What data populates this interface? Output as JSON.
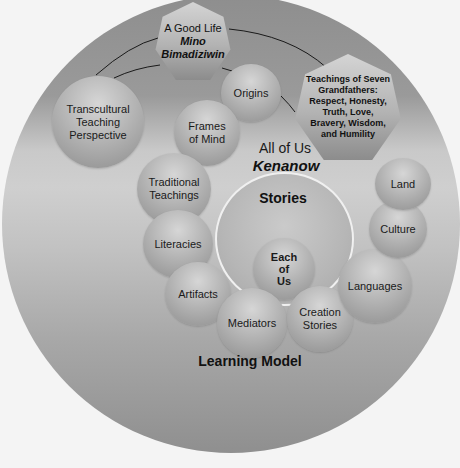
{
  "diagram": {
    "title": "Learning Model",
    "colors": {
      "background": "#f4f4f4",
      "outer_circle_dark": "#8e8e8e",
      "outer_circle_light": "#cfcfcf",
      "node_fill": "#b5b5b5",
      "ring_stroke": "#f0f0f0",
      "text": "#1a1a1a"
    },
    "heptagons": {
      "good_life": {
        "line1": "A Good Life",
        "line2": "Mino",
        "line3": "Bimadiziwin"
      },
      "seven_grandfathers": {
        "line1": "Teachings of Seven",
        "line2": "Grandfathers:",
        "line3": "Respect, Honesty,",
        "line4": "Truth, Love,",
        "line5": "Bravery, Wisdom,",
        "line6": "and Humility"
      }
    },
    "nodes": {
      "transcultural": {
        "line1": "Transcultural",
        "line2": "Teaching",
        "line3": "Perspective"
      },
      "origins": {
        "line1": "Origins"
      },
      "frames_of_mind": {
        "line1": "Frames",
        "line2": "of Mind"
      },
      "traditional_teachings": {
        "line1": "Traditional",
        "line2": "Teachings"
      },
      "literacies": {
        "line1": "Literacies"
      },
      "artifacts": {
        "line1": "Artifacts"
      },
      "mediators": {
        "line1": "Mediators"
      },
      "creation_stories": {
        "line1": "Creation",
        "line2": "Stories"
      },
      "languages": {
        "line1": "Languages"
      },
      "culture": {
        "line1": "Culture"
      },
      "land": {
        "line1": "Land"
      },
      "each_of_us": {
        "line1": "Each",
        "line2": "of",
        "line3": "Us"
      }
    },
    "labels": {
      "all_of_us": "All of Us",
      "kenanow": "Kenanow",
      "stories": "Stories",
      "learning_model": "Learning Model"
    }
  }
}
